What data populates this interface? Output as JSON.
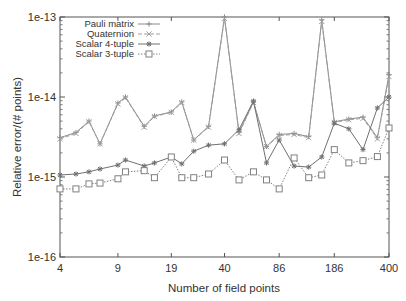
{
  "chart_data": {
    "type": "line",
    "title": "",
    "xlabel": "Number of field points",
    "ylabel": "Relative error/(# points)",
    "xscale": "log",
    "yscale": "log",
    "xlim": [
      4,
      400
    ],
    "ylim": [
      1e-16,
      1e-13
    ],
    "grid": false,
    "legend_position": "upper-left",
    "x_tick_labels": [
      "4",
      "9",
      "19",
      "40",
      "86",
      "186",
      "400"
    ],
    "x_ticks": [
      4,
      9,
      19,
      40,
      86,
      186,
      400
    ],
    "y_tick_labels": [
      "1e-16",
      "1e-15",
      "1e-14",
      "1e-13"
    ],
    "y_ticks": [
      1e-16,
      1e-15,
      1e-14,
      1e-13
    ],
    "x": [
      4,
      5,
      6,
      7,
      9,
      10,
      13,
      15,
      19,
      22,
      26,
      32,
      40,
      49,
      60,
      72,
      86,
      106,
      130,
      156,
      186,
      228,
      278,
      340,
      400
    ],
    "series": [
      {
        "name": "Pauli matrix",
        "marker": "plus",
        "line": "solid",
        "color": "#8a8a8a",
        "values": [
          3.1e-15,
          3.6e-15,
          5e-15,
          2.6e-15,
          8.4e-15,
          1e-14,
          4.3e-15,
          5.8e-15,
          6.5e-15,
          8.7e-15,
          2.9e-15,
          4.3e-15,
          1e-13,
          3.6e-15,
          8.7e-15,
          2.4e-15,
          3.4e-15,
          3.5e-15,
          3.2e-15,
          9.2e-14,
          4.9e-15,
          5.3e-15,
          5.6e-15,
          3.1e-15,
          1.9e-14
        ]
      },
      {
        "name": "Quaternion",
        "marker": "x",
        "line": "dashed",
        "color": "#a0a0a0",
        "values": [
          3e-15,
          3.5e-15,
          4.9e-15,
          2.6e-15,
          8.2e-15,
          9.8e-15,
          4.2e-15,
          5.7e-15,
          6.4e-15,
          8.5e-15,
          2.9e-15,
          4.2e-15,
          9.6e-14,
          3.5e-15,
          8.5e-15,
          2.4e-15,
          3.3e-15,
          3.4e-15,
          3.1e-15,
          8.8e-14,
          4.8e-15,
          5.2e-15,
          5.4e-15,
          3e-15,
          1.8e-14
        ]
      },
      {
        "name": "Scalar 4-tuple",
        "marker": "star",
        "line": "solid",
        "color": "#707070",
        "values": [
          1.06e-15,
          1.09e-15,
          1.16e-15,
          1.26e-15,
          1.41e-15,
          1.63e-15,
          1.37e-15,
          1.5e-15,
          1.78e-15,
          1.46e-15,
          2.1e-15,
          2.5e-15,
          2.6e-15,
          3.9e-15,
          8.9e-15,
          1.5e-15,
          2.9e-15,
          1.37e-15,
          1.33e-15,
          1.78e-15,
          4.7e-15,
          4e-15,
          2.2e-15,
          7.3e-15,
          1e-14
        ]
      },
      {
        "name": "Scalar 3-tuple",
        "marker": "square",
        "line": "dotted",
        "color": "#808080",
        "values": [
          7.1e-16,
          7.1e-16,
          8.2e-16,
          8.4e-16,
          9.5e-16,
          1.16e-15,
          1.2e-15,
          9.8e-16,
          1.78e-15,
          9.8e-16,
          9.8e-16,
          1.09e-15,
          1.63e-15,
          9.2e-16,
          1.16e-15,
          9.2e-16,
          7.1e-16,
          1.73e-15,
          9.8e-16,
          1.06e-15,
          2.2e-15,
          1.5e-15,
          1.6e-15,
          1.8e-15,
          4.1e-15
        ]
      }
    ]
  },
  "plot": {
    "left": 60,
    "right": 389,
    "top": 17,
    "bottom": 257
  }
}
